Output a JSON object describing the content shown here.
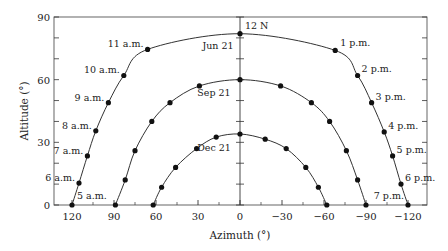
{
  "chart_data": {
    "type": "line",
    "title": "",
    "xlabel": "Azimuth (°)",
    "ylabel": "Altitude (°)",
    "xlim": [
      130,
      -135
    ],
    "ylim": [
      0,
      90
    ],
    "x_reversed": true,
    "xticks": [
      120,
      90,
      60,
      30,
      0,
      -30,
      -60,
      -90,
      -120
    ],
    "xtick_labels": [
      "120",
      "90",
      "60",
      "30",
      "0",
      "−30",
      "−60",
      "−90",
      "−120"
    ],
    "yticks": [
      0,
      30,
      60,
      90
    ],
    "ytick_labels": [
      "0",
      "30",
      "60",
      "90"
    ],
    "grid": false,
    "legend": null,
    "series": [
      {
        "name": "Jun 21",
        "label_position": "left-of-noon",
        "points": [
          {
            "azimuth": 120,
            "altitude": 0,
            "label": "5 a.m."
          },
          {
            "azimuth": 115,
            "altitude": 10.5,
            "label": "6 a.m."
          },
          {
            "azimuth": 109,
            "altitude": 23.5,
            "label": "7 a.m."
          },
          {
            "azimuth": 103,
            "altitude": 35.5,
            "label": "8 a.m."
          },
          {
            "azimuth": 94,
            "altitude": 49,
            "label": "9 a.m."
          },
          {
            "azimuth": 83,
            "altitude": 62,
            "label": "10 a.m."
          },
          {
            "azimuth": 66,
            "altitude": 74.5,
            "label": "11 a.m."
          },
          {
            "azimuth": 0,
            "altitude": 82,
            "label": "12 N"
          },
          {
            "azimuth": -68,
            "altitude": 74,
            "label": "1 p.m."
          },
          {
            "azimuth": -84,
            "altitude": 62,
            "label": "2 p.m."
          },
          {
            "azimuth": -94,
            "altitude": 49,
            "label": "3 p.m."
          },
          {
            "azimuth": -103,
            "altitude": 35,
            "label": "4 p.m."
          },
          {
            "azimuth": -109,
            "altitude": 23.5,
            "label": "5 p.m."
          },
          {
            "azimuth": -115,
            "altitude": 10,
            "label": "6 p.m."
          },
          {
            "azimuth": -120,
            "altitude": 0,
            "label": "7 p.m."
          }
        ]
      },
      {
        "name": "Sep 21",
        "points": [
          {
            "azimuth": 89,
            "altitude": 0
          },
          {
            "azimuth": 82,
            "altitude": 12
          },
          {
            "azimuth": 75,
            "altitude": 26
          },
          {
            "azimuth": 63,
            "altitude": 40
          },
          {
            "azimuth": 50,
            "altitude": 49
          },
          {
            "azimuth": 29,
            "altitude": 57
          },
          {
            "azimuth": 0,
            "altitude": 60
          },
          {
            "azimuth": -29,
            "altitude": 57
          },
          {
            "azimuth": -51,
            "altitude": 49
          },
          {
            "azimuth": -64,
            "altitude": 40
          },
          {
            "azimuth": -76,
            "altitude": 26
          },
          {
            "azimuth": -84,
            "altitude": 12
          },
          {
            "azimuth": -90,
            "altitude": 0
          }
        ]
      },
      {
        "name": "Dec 21",
        "points": [
          {
            "azimuth": 62,
            "altitude": 0
          },
          {
            "azimuth": 56,
            "altitude": 8.5
          },
          {
            "azimuth": 46,
            "altitude": 18
          },
          {
            "azimuth": 31,
            "altitude": 27
          },
          {
            "azimuth": 17,
            "altitude": 32.5
          },
          {
            "azimuth": 0,
            "altitude": 34
          },
          {
            "azimuth": -18,
            "altitude": 31.5
          },
          {
            "azimuth": -33,
            "altitude": 27
          },
          {
            "azimuth": -47,
            "altitude": 18
          },
          {
            "azimuth": -56,
            "altitude": 8.5
          },
          {
            "azimuth": -62,
            "altitude": 0
          }
        ]
      }
    ],
    "annotations": [
      "12 N",
      "Jun 21",
      "Sep 21",
      "Dec 21"
    ]
  }
}
